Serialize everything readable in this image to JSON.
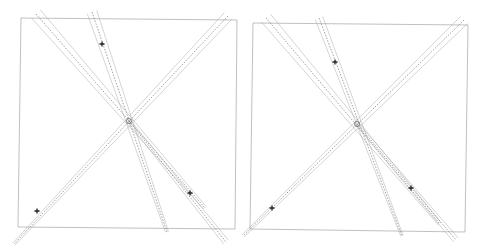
{
  "figure": {
    "background": "#ffffff",
    "frame_color": "#b0b0b0",
    "line_color": "#9a9a9a",
    "dash_color": "#555555",
    "marker_color": "#222222"
  },
  "panels": [
    {
      "name": "left-view",
      "frame": [
        [
          21,
          18
        ],
        [
          237,
          20
        ],
        [
          235,
          229
        ],
        [
          18,
          227
        ]
      ],
      "epipole": [
        129,
        121
      ],
      "markers": [
        [
          102,
          44
        ],
        [
          37,
          211
        ],
        [
          190,
          193
        ]
      ],
      "lines": [
        {
          "from": [
            36,
            14
          ],
          "to": [
            129,
            121
          ],
          "ext": [
            205,
            208
          ],
          "kind": "band",
          "offsets": [
            -6,
            0,
            6
          ]
        },
        {
          "from": [
            92,
            12
          ],
          "to": [
            129,
            121
          ],
          "ext": [
            167,
            232
          ],
          "kind": "band",
          "offsets": [
            -5,
            0,
            5
          ]
        },
        {
          "from": [
            228,
            16
          ],
          "to": [
            129,
            121
          ],
          "ext": [
            14,
            244
          ],
          "kind": "band",
          "offsets": [
            -5,
            0,
            5
          ]
        },
        {
          "from": [
            129,
            121
          ],
          "to": [
            226,
            242
          ],
          "kind": "band",
          "offsets": [
            -3,
            0,
            3
          ]
        }
      ]
    },
    {
      "name": "right-view",
      "frame": [
        [
          253,
          23
        ],
        [
          468,
          25
        ],
        [
          465,
          232
        ],
        [
          250,
          229
        ]
      ],
      "epipole": [
        357,
        124
      ],
      "markers": [
        [
          335,
          62
        ],
        [
          272,
          208
        ],
        [
          411,
          188
        ]
      ],
      "lines": [
        {
          "from": [
            266,
            18
          ],
          "to": [
            357,
            124
          ],
          "ext": [
            440,
            224
          ],
          "kind": "band",
          "offsets": [
            -6,
            0,
            6
          ]
        },
        {
          "from": [
            319,
            18
          ],
          "to": [
            357,
            124
          ],
          "ext": [
            402,
            236
          ],
          "kind": "band",
          "offsets": [
            -4,
            0,
            4
          ]
        },
        {
          "from": [
            464,
            20
          ],
          "to": [
            357,
            124
          ],
          "ext": [
            243,
            236
          ],
          "kind": "band",
          "offsets": [
            -5,
            0,
            5
          ]
        },
        {
          "from": [
            357,
            124
          ],
          "to": [
            456,
            240
          ],
          "kind": "band",
          "offsets": [
            -3,
            0,
            3
          ]
        }
      ]
    }
  ]
}
